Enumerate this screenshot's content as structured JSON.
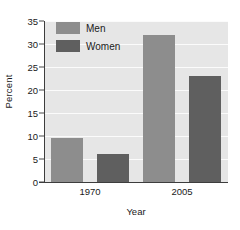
{
  "chart_data": {
    "type": "bar",
    "title": "",
    "xlabel": "Year",
    "ylabel": "Percent",
    "categories": [
      "1970",
      "2005"
    ],
    "series": [
      {
        "name": "Men",
        "values": [
          9.5,
          32
        ],
        "color": "#8d8d8d"
      },
      {
        "name": "Women",
        "values": [
          6,
          23
        ],
        "color": "#5f5f5f"
      }
    ],
    "ylim": [
      0,
      35
    ],
    "yticks": [
      0,
      5,
      10,
      15,
      20,
      25,
      30,
      35
    ],
    "yticklabels": [
      "0",
      "5",
      "10",
      "15",
      "20",
      "25",
      "30",
      "35"
    ],
    "grid": true,
    "grid_axis": "y",
    "grid_color": "#fbfbfb",
    "legend_position": "upper left",
    "legend_inside_plot": true,
    "plot_background": "#e6e6e6",
    "figure_background": "#ffffff",
    "axis_color": "#3d3d3d",
    "text_color": "#1a1a1a"
  },
  "legend": {
    "items": [
      {
        "label": "Men"
      },
      {
        "label": "Women"
      }
    ]
  },
  "axes": {
    "y_title": "Percent",
    "x_title": "Year"
  }
}
